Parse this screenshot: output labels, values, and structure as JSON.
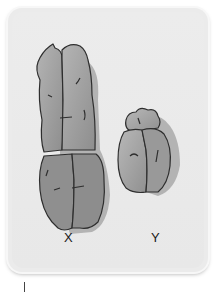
{
  "figure": {
    "chromosomes": [
      {
        "id": "x",
        "label": "X",
        "relative_size": "large",
        "fill": "#9a9a9a",
        "shadow": "#a8a8a8"
      },
      {
        "id": "y",
        "label": "Y",
        "relative_size": "small",
        "fill": "#9c9c9c",
        "shadow": "#a8a8a8"
      }
    ],
    "card_background": "#ebebeb",
    "outline_color": "#2e2e2e"
  }
}
